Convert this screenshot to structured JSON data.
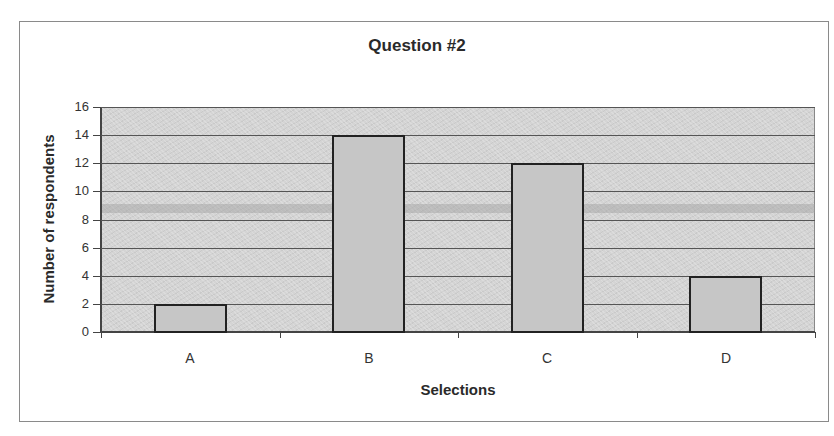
{
  "chart_data": {
    "type": "bar",
    "title": "Question #2",
    "xlabel": "Selections",
    "ylabel": "Number of respondents",
    "categories": [
      "A",
      "B",
      "C",
      "D"
    ],
    "values": [
      2,
      14,
      12,
      4
    ],
    "ylim": [
      0,
      16
    ],
    "yticks": [
      0,
      2,
      4,
      6,
      8,
      10,
      12,
      14,
      16
    ],
    "grid": true,
    "legend": null
  },
  "colors": {
    "plot_background": "#d4d4d4",
    "bar_fill": "#c6c6c6",
    "bar_border": "#222222"
  }
}
